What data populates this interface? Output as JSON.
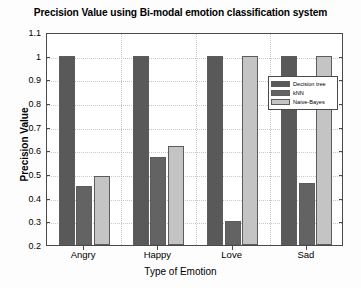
{
  "chart_data": {
    "type": "bar",
    "title": "Precision Value using Bi-modal emotion classification system",
    "xlabel": "Type of Emotion",
    "ylabel": "Precision Value",
    "categories": [
      "Angry",
      "Happy",
      "Love",
      "Sad"
    ],
    "series": [
      {
        "name": "Decision tree",
        "color": "#595959",
        "values": [
          1.0,
          1.0,
          1.0,
          1.0
        ]
      },
      {
        "name": "kNN",
        "color": "#636363",
        "values": [
          0.45,
          0.57,
          0.3,
          0.46
        ]
      },
      {
        "name": "Naive-Bayes",
        "color": "#c4c4c4",
        "values": [
          0.49,
          0.62,
          1.0,
          1.0
        ]
      }
    ],
    "ylim": [
      0.2,
      1.1
    ],
    "yticks": [
      0.2,
      0.3,
      0.4,
      0.5,
      0.6,
      0.7,
      0.8,
      0.9,
      1.0,
      1.1
    ],
    "ytick_labels": [
      "0.2",
      "0.3",
      "0.4",
      "0.5",
      "0.6",
      "0.7",
      "0.8",
      "0.9",
      "1",
      "1.1"
    ],
    "grid": true,
    "legend_position": "upper right"
  }
}
